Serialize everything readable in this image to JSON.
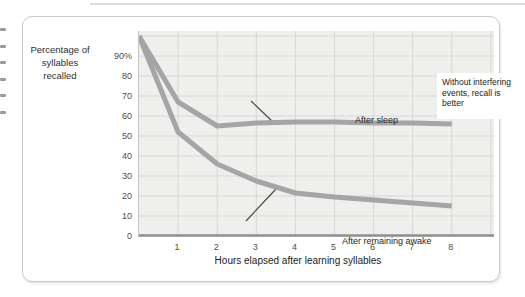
{
  "chart_data": {
    "type": "line",
    "xlabel": "Hours elapsed after learning syllables",
    "ylabel": "Percentage of syllables recalled",
    "ylabel_lines": [
      "Percentage of",
      "syllables",
      "recalled"
    ],
    "x": [
      0,
      1,
      2,
      3,
      4,
      5,
      6,
      7,
      8
    ],
    "series": [
      {
        "name": "After sleep",
        "values": [
          100,
          67,
          55,
          56.5,
          57,
          57,
          56.5,
          56.5,
          56
        ]
      },
      {
        "name": "After remaining awake",
        "values": [
          100,
          52,
          36,
          27.5,
          21.5,
          19.5,
          18,
          16.5,
          15
        ]
      }
    ],
    "xticks": [
      "1",
      "2",
      "3",
      "4",
      "5",
      "6",
      "7",
      "8"
    ],
    "yticks": [
      "90%",
      "80",
      "70",
      "60",
      "50",
      "40",
      "30",
      "20",
      "10",
      "0"
    ],
    "ylim": [
      0,
      100
    ],
    "xlim": [
      0,
      9
    ],
    "grid": true,
    "legend_position": "inline-labels",
    "annotation": "Without interfering events, recall is better",
    "annotation_lines": [
      "Without interfering",
      "events, recall is",
      "better"
    ],
    "line_color": "#a5a5a5",
    "plot_background": "#efefed",
    "grid_color": "#d7d7d5"
  }
}
